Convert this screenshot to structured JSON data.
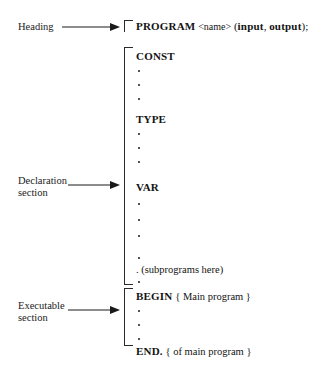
{
  "diagram": {
    "background_color": "#ffffff",
    "ink_color": "#1a1a1a"
  },
  "labels": [
    {
      "id": "heading",
      "line1": "Heading",
      "line2": ""
    },
    {
      "id": "declaration",
      "line1": "Declaration",
      "line2": "section"
    },
    {
      "id": "executable",
      "line1": "Executable",
      "line2": "section"
    }
  ],
  "heading_block": {
    "keyword": "PROGRAM",
    "name_placeholder": "<name>",
    "open_paren": "(",
    "param1": "input",
    "comma": ", ",
    "param2": "output",
    "close_paren": ")",
    "semicolon": ";"
  },
  "declaration_block": {
    "const_keyword": "CONST",
    "type_keyword": "TYPE",
    "var_keyword": "VAR",
    "dot_glyph": ".",
    "subprograms_note": "(subprograms here)"
  },
  "executable_block": {
    "begin_keyword": "BEGIN",
    "begin_comment": "{ Main program }",
    "end_keyword": "END.",
    "end_comment": "{ of main program }",
    "dot_glyph": "."
  }
}
